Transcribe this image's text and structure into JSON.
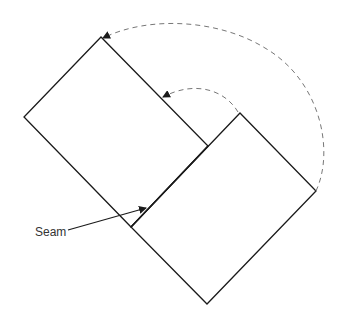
{
  "diagram": {
    "title": "",
    "labels": {
      "seam": "Seam"
    },
    "colors": {
      "stroke": "#1a1a1a",
      "dashed": "#777777",
      "label": "#333333",
      "background": "#ffffff"
    },
    "shapes": [
      {
        "name": "upper-left-square",
        "points": "101,37 24,117 131,227 208,146"
      },
      {
        "name": "lower-right-square",
        "points": "240,113 316,191 207,304 131,227"
      }
    ],
    "arrows": [
      {
        "name": "outer-fold-arrow",
        "style": "dashed",
        "from": "right vertex of lower square",
        "to": "top vertex of upper square"
      },
      {
        "name": "inner-fold-arrow",
        "style": "dashed",
        "from": "top vertex of lower square",
        "to": "right edge of upper square"
      },
      {
        "name": "seam-pointer-arrow",
        "style": "solid",
        "from": "Seam label",
        "to": "seam line"
      }
    ]
  }
}
